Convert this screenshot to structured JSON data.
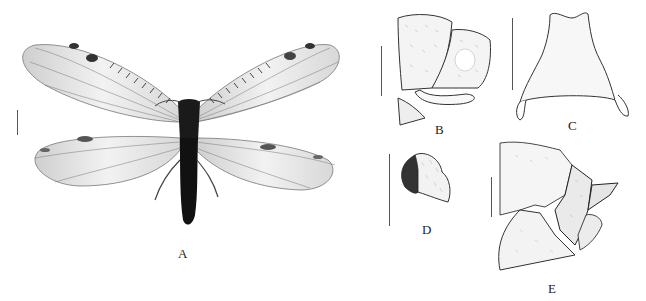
{
  "figure": {
    "panels": [
      {
        "id": "A",
        "label": "A",
        "subject": "adult habitus, dorsal view (winged insect)"
      },
      {
        "id": "B",
        "label": "B",
        "subject": "male terminalia, lateral view"
      },
      {
        "id": "C",
        "label": "C",
        "subject": "sclerite, ventral view"
      },
      {
        "id": "D",
        "label": "D",
        "subject": "structure with hatched region, lateral view"
      },
      {
        "id": "E",
        "label": "E",
        "subject": "female terminalia, lateral view"
      }
    ],
    "colors": {
      "background": "#ffffff",
      "ink": "#222222",
      "body": "#1a1a1a",
      "wing": "#e8e8e8",
      "vein": "#555555"
    }
  }
}
